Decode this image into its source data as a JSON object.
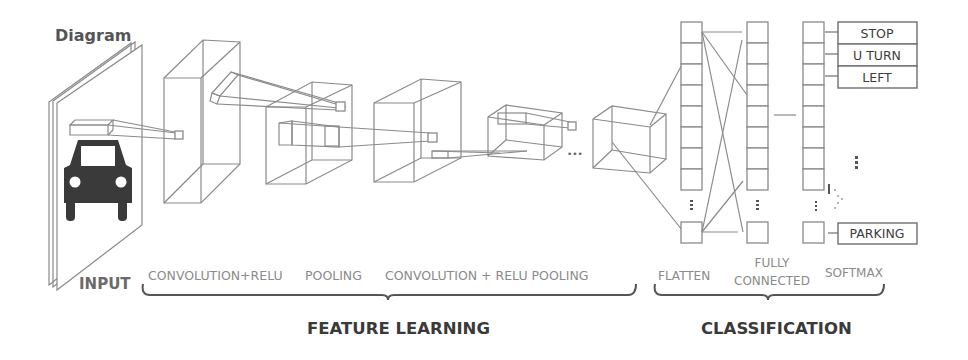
{
  "diagram": {
    "title": "Diagram",
    "colors": {
      "line": "#8a8a8a",
      "car": "#3a3a3a",
      "heading": "#3a3a3a",
      "stage_label": "#8a8a8a",
      "background": "#ffffff"
    },
    "input": {
      "label": "INPUT",
      "icon": "car-icon"
    },
    "stages": [
      {
        "id": "conv1",
        "label": "CONVOLUTION+RELU"
      },
      {
        "id": "pool1",
        "label": "POOLING"
      },
      {
        "id": "conv2",
        "label": "CONVOLUTION + RELU POOLING"
      },
      {
        "id": "flatten",
        "label": "FLATTEN"
      },
      {
        "id": "fc",
        "label_line1": "FULLY",
        "label_line2": "CONNECTED"
      },
      {
        "id": "softmax",
        "label": "SOFTMAX"
      }
    ],
    "groups": [
      {
        "id": "feature-learning",
        "label": "FEATURE LEARNING"
      },
      {
        "id": "classification",
        "label": "CLASSIFICATION"
      }
    ],
    "classes": [
      "STOP",
      "U TURN",
      "LEFT",
      "PARKING"
    ],
    "ellipsis": "•••"
  }
}
